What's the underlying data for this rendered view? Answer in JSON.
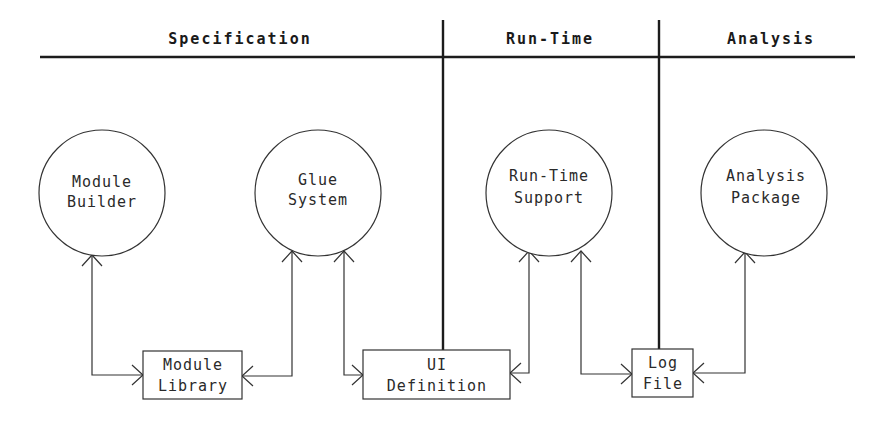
{
  "diagram": {
    "phases": [
      {
        "id": "specification",
        "label": "Specification",
        "x": 240
      },
      {
        "id": "run-time",
        "label": "Run-Time",
        "x": 550
      },
      {
        "id": "analysis",
        "label": "Analysis",
        "x": 771
      }
    ],
    "processes": [
      {
        "id": "module-builder",
        "lines": [
          "Module",
          "Builder"
        ],
        "cx": 102,
        "cy": 193,
        "r": 63
      },
      {
        "id": "glue-system",
        "lines": [
          "Glue",
          "System"
        ],
        "cx": 318,
        "cy": 193,
        "r": 63
      },
      {
        "id": "run-time-support",
        "lines": [
          "Run-Time",
          "Support"
        ],
        "cx": 549,
        "cy": 193,
        "r": 63
      },
      {
        "id": "analysis-package",
        "lines": [
          "Analysis",
          "Package"
        ],
        "cx": 764,
        "cy": 193,
        "r": 63
      }
    ],
    "stores": [
      {
        "id": "module-library",
        "lines": [
          "Module",
          "Library"
        ],
        "x": 143,
        "y": 351,
        "w": 99,
        "h": 48
      },
      {
        "id": "ui-definition",
        "lines": [
          "UI",
          "Definition"
        ],
        "x": 363,
        "y": 350,
        "w": 147,
        "h": 49
      },
      {
        "id": "log-file",
        "lines": [
          "Log",
          "File"
        ],
        "x": 632,
        "y": 349,
        "w": 61,
        "h": 48
      }
    ],
    "connections": [
      {
        "from": "module-builder",
        "to": "module-library"
      },
      {
        "from": "glue-system",
        "to": "module-library"
      },
      {
        "from": "glue-system",
        "to": "ui-definition"
      },
      {
        "from": "run-time-support",
        "to": "ui-definition"
      },
      {
        "from": "run-time-support",
        "to": "log-file"
      },
      {
        "from": "analysis-package",
        "to": "log-file"
      }
    ],
    "colors": {
      "ink": "#1c1c1c",
      "background": "#ffffff"
    }
  }
}
